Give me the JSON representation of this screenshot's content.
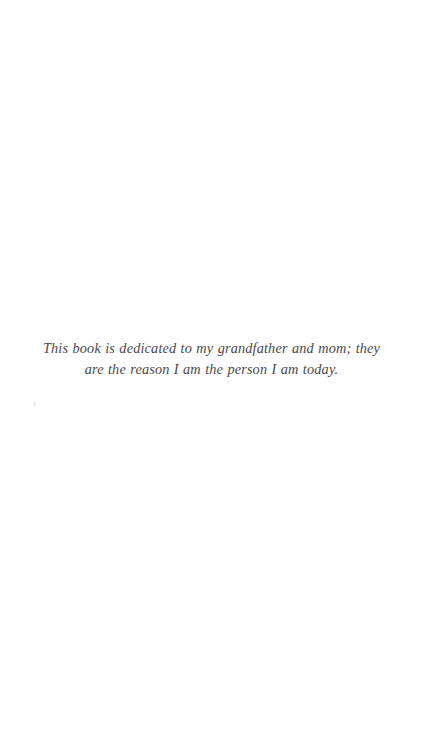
{
  "page": {
    "kind": "book-dedication-page",
    "background_color": "#ffffff",
    "text_color": "#3c3a3b"
  },
  "dedication": {
    "text": "This book is dedicated to my grandfather and mom; they are the reason I am the person I am today."
  }
}
